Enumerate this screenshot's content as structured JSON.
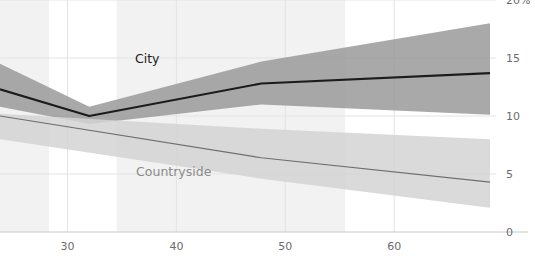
{
  "chart_data": {
    "type": "line",
    "title": "",
    "subtitle": "",
    "xlabel": "",
    "ylabel": "",
    "xlim": [
      23.8,
      68.8
    ],
    "ylim": [
      0,
      20
    ],
    "grid": true,
    "legend_position": "inline-annotations",
    "y_unit": "%",
    "x_ticks": [
      30,
      40,
      50,
      60
    ],
    "x_tick_labels": [
      "30",
      "40",
      "50",
      "60"
    ],
    "y_ticks": [
      0,
      5,
      10,
      15,
      20
    ],
    "y_tick_labels": [
      "0",
      "5",
      "10",
      "15",
      "20%"
    ],
    "annotations": [
      {
        "name": "city",
        "text": "City",
        "x": 36.2,
        "y": 14.6
      },
      {
        "name": "countryside",
        "text": "Countryside",
        "x": 36.3,
        "y": 4.8
      }
    ],
    "shaded_x_bands": [
      {
        "x0": 23.8,
        "x1": 28.3
      },
      {
        "x0": 34.5,
        "x1": 55.5
      }
    ],
    "series": [
      {
        "name": "City",
        "color": "#1c1c1c",
        "band_color": "#9a9a9a",
        "x": [
          23.8,
          32.0,
          47.8,
          68.8
        ],
        "values": [
          12.3,
          10.0,
          12.8,
          13.7
        ],
        "band_lower": [
          10.8,
          9.3,
          11.0,
          10.1
        ],
        "band_upper": [
          14.5,
          10.8,
          14.7,
          18.0
        ]
      },
      {
        "name": "Countryside",
        "color": "#6e6e6e",
        "band_color": "#d3d3d3",
        "x": [
          23.8,
          47.8,
          68.8
        ],
        "values": [
          10.0,
          6.4,
          4.3
        ],
        "band_lower": [
          8.0,
          4.6,
          2.1
        ],
        "band_upper": [
          10.2,
          8.9,
          8.0
        ]
      }
    ],
    "colors": {
      "background": "#ffffff",
      "grid": "#e3e3e3",
      "axis_text": "#6b6b6b",
      "band_shade": "#f2f2f2"
    }
  }
}
